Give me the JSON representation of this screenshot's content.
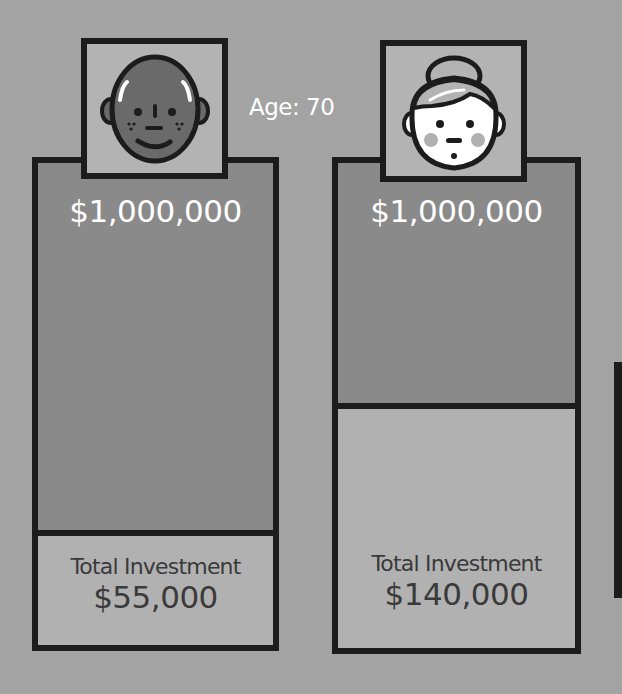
{
  "age_label": "Age: 70",
  "people": [
    {
      "avatar": "bald-man-avatar",
      "final_value": "$1,000,000",
      "investment_label": "Total Investment",
      "investment_value": "$55,000"
    },
    {
      "avatar": "woman-hair-bun-avatar",
      "final_value": "$1,000,000",
      "investment_label": "Total Investment",
      "investment_value": "$140,000"
    }
  ],
  "colors": {
    "background": "#a3a3a3",
    "growth_fill": "#8a8a8a",
    "investment_fill": "#b1b1b1",
    "border": "#1c1c1c",
    "text_light": "#ffffff",
    "text_dark": "#3a3a3a"
  }
}
